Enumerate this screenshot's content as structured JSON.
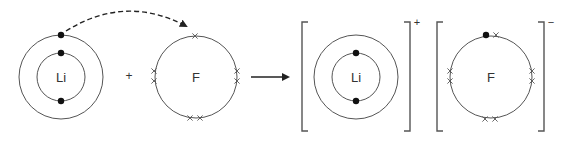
{
  "reactants": {
    "lithium": {
      "symbol": "Li",
      "center": [
        61,
        77
      ],
      "shells": [
        24,
        42
      ],
      "electrons_inner": [
        [
          61,
          53
        ],
        [
          61,
          101
        ]
      ],
      "electrons_outer": [
        [
          61,
          35
        ]
      ]
    },
    "plus_sign": "+",
    "fluorine": {
      "symbol": "F",
      "center": [
        196,
        77
      ],
      "shell": 41,
      "crosses": [
        [
          195,
          36
        ],
        [
          154,
          71
        ],
        [
          154,
          81
        ],
        [
          237,
          71
        ],
        [
          237,
          81
        ],
        [
          190,
          118
        ],
        [
          200,
          118
        ]
      ]
    }
  },
  "transfer_arrow": {
    "style": "dashed-curved",
    "path": "M66,31 Q125,-6 186,26"
  },
  "reaction_arrow": {
    "x1": 251,
    "x2": 292,
    "y": 77
  },
  "products": {
    "lithium_ion": {
      "symbol": "Li",
      "charge": "+",
      "center": [
        356,
        77
      ],
      "shells": [
        24,
        42
      ],
      "electrons_inner": [
        [
          356,
          53
        ],
        [
          356,
          101
        ]
      ],
      "bracket": {
        "left": 302,
        "right": 410,
        "top": 22,
        "bottom": 131
      }
    },
    "fluoride_ion": {
      "symbol": "F",
      "charge": "−",
      "center": [
        491,
        77
      ],
      "shell": 41,
      "electron_dots": [
        [
          486,
          35
        ]
      ],
      "crosses": [
        [
          496,
          35
        ],
        [
          450,
          71
        ],
        [
          450,
          81
        ],
        [
          532,
          71
        ],
        [
          532,
          81
        ],
        [
          485,
          119
        ],
        [
          495,
          119
        ]
      ],
      "bracket": {
        "left": 437,
        "right": 544,
        "top": 22,
        "bottom": 131
      }
    }
  }
}
